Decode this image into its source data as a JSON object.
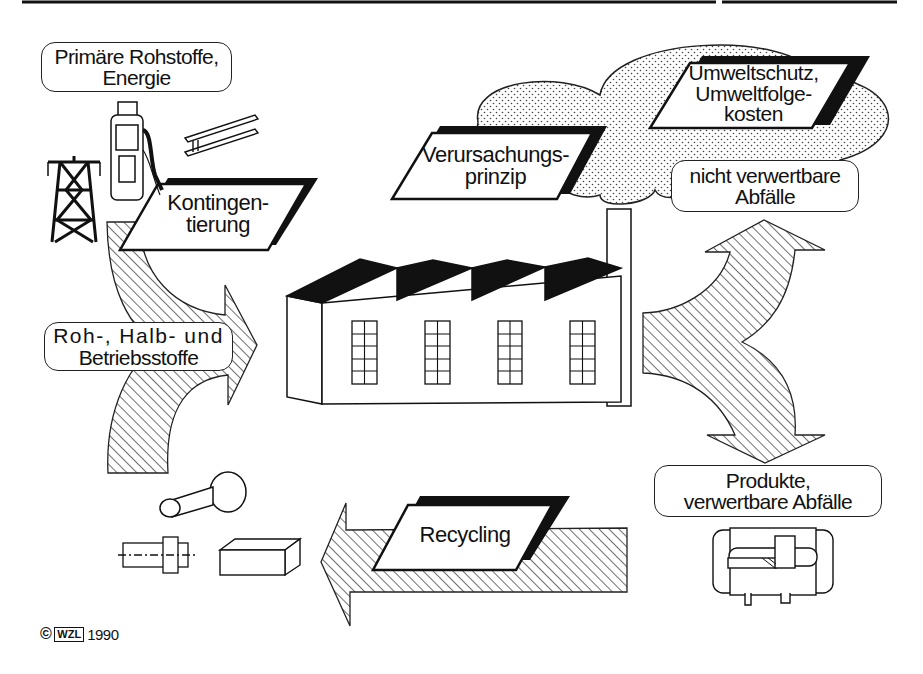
{
  "diagram": {
    "title_rule": true,
    "center": "factory",
    "labels": {
      "primary_resources": {
        "line1": "Primäre Rohstoffe,",
        "line2": "Energie"
      },
      "quota": {
        "line1": "Kontingen-",
        "line2": "tierung"
      },
      "polluter_pays": {
        "line1": "Verursachungs-",
        "line2": "prinzip"
      },
      "environment": {
        "line1": "Umweltschutz,",
        "line2": "Umweltfolge-",
        "line3": "kosten"
      },
      "non_recyclable_waste": {
        "line1": "nicht verwertbare",
        "line2": "Abfälle"
      },
      "materials": {
        "line1": "Roh-, Halb- und",
        "line2": "Betriebsstoffe"
      },
      "products": {
        "line1": "Produkte,",
        "line2": "verwertbare Abfälle"
      },
      "recycling": {
        "line1": "Recycling"
      }
    },
    "icons": [
      "power-pylon-icon",
      "fuel-pump-icon",
      "steel-beam-icon",
      "factory-icon",
      "smoke-cloud-icon",
      "gearbox-icon",
      "shaft-part-icon",
      "stepped-shaft-drawing-icon",
      "block-part-icon"
    ],
    "flows": [
      {
        "from": "primary_resources",
        "to": "factory",
        "style": "hatched-arrow"
      },
      {
        "from": "factory",
        "to": "non_recyclable_waste",
        "style": "hatched-arrow"
      },
      {
        "from": "factory",
        "to": "products",
        "style": "hatched-arrow"
      },
      {
        "from": "products",
        "to": "materials",
        "label": "Recycling",
        "style": "hatched-arrow"
      }
    ],
    "colors": {
      "ink": "#111111",
      "background": "#ffffff"
    }
  },
  "footer": {
    "copyright_symbol": "©",
    "logo": "WZL",
    "year": "1990"
  }
}
